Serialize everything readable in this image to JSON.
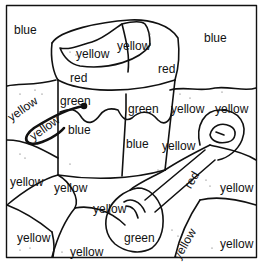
{
  "page": {
    "colors": {
      "blue": "#3b6fd6",
      "yellow": "#f2d23a",
      "red": "#d8342b",
      "green": "#3aa64a",
      "line": "#111111"
    }
  },
  "labels": [
    {
      "id": "sky-left",
      "text": "blue",
      "x": 14,
      "y": 24,
      "rot": 0
    },
    {
      "id": "sky-right",
      "text": "blue",
      "x": 204,
      "y": 32,
      "rot": 0
    },
    {
      "id": "sand-in-bucket-left",
      "text": "yellow",
      "x": 76,
      "y": 48,
      "rot": 0
    },
    {
      "id": "sand-in-bucket-right",
      "text": "yellow",
      "x": 117,
      "y": 40,
      "rot": 0
    },
    {
      "id": "bucket-rim-left",
      "text": "red",
      "x": 70,
      "y": 72,
      "rot": 0
    },
    {
      "id": "bucket-rim-right",
      "text": "red",
      "x": 158,
      "y": 63,
      "rot": 0
    },
    {
      "id": "bucket-band-left",
      "text": "green",
      "x": 60,
      "y": 95,
      "rot": 0
    },
    {
      "id": "bucket-band-right",
      "text": "green",
      "x": 128,
      "y": 103,
      "rot": 0
    },
    {
      "id": "bucket-body-left",
      "text": "blue",
      "x": 68,
      "y": 124,
      "rot": 0
    },
    {
      "id": "bucket-body-right",
      "text": "blue",
      "x": 126,
      "y": 138,
      "rot": 0
    },
    {
      "id": "sand-left-top",
      "text": "yellow",
      "x": 8,
      "y": 100,
      "rot": -35
    },
    {
      "id": "handle-inner",
      "text": "yellow",
      "x": 30,
      "y": 116,
      "rot": -35
    },
    {
      "id": "sand-mid-right-1",
      "text": "yellow",
      "x": 171,
      "y": 103,
      "rot": 0
    },
    {
      "id": "sand-mid-right-2",
      "text": "yellow",
      "x": 215,
      "y": 103,
      "rot": 0
    },
    {
      "id": "sand-mid-right-3",
      "text": "yellow",
      "x": 162,
      "y": 140,
      "rot": 0
    },
    {
      "id": "sand-lower-left-1",
      "text": "yellow",
      "x": 10,
      "y": 176,
      "rot": 0
    },
    {
      "id": "sand-lower-left-2",
      "text": "yellow",
      "x": 54,
      "y": 182,
      "rot": 0
    },
    {
      "id": "sand-lower-mid",
      "text": "yellow",
      "x": 93,
      "y": 203,
      "rot": 0
    },
    {
      "id": "shovel-handle",
      "text": "red",
      "x": 183,
      "y": 174,
      "rot": -60
    },
    {
      "id": "sand-right-mid",
      "text": "yellow",
      "x": 220,
      "y": 182,
      "rot": 0
    },
    {
      "id": "sand-bottom-left",
      "text": "yellow",
      "x": 17,
      "y": 232,
      "rot": 0
    },
    {
      "id": "sand-bottom-mid",
      "text": "yellow",
      "x": 70,
      "y": 246,
      "rot": 0
    },
    {
      "id": "shovel-blade",
      "text": "green",
      "x": 124,
      "y": 232,
      "rot": 0
    },
    {
      "id": "sand-bottom-right-1",
      "text": "yellow",
      "x": 172,
      "y": 245,
      "rot": -60
    },
    {
      "id": "sand-bottom-right-2",
      "text": "yellow",
      "x": 220,
      "y": 238,
      "rot": 0
    }
  ]
}
